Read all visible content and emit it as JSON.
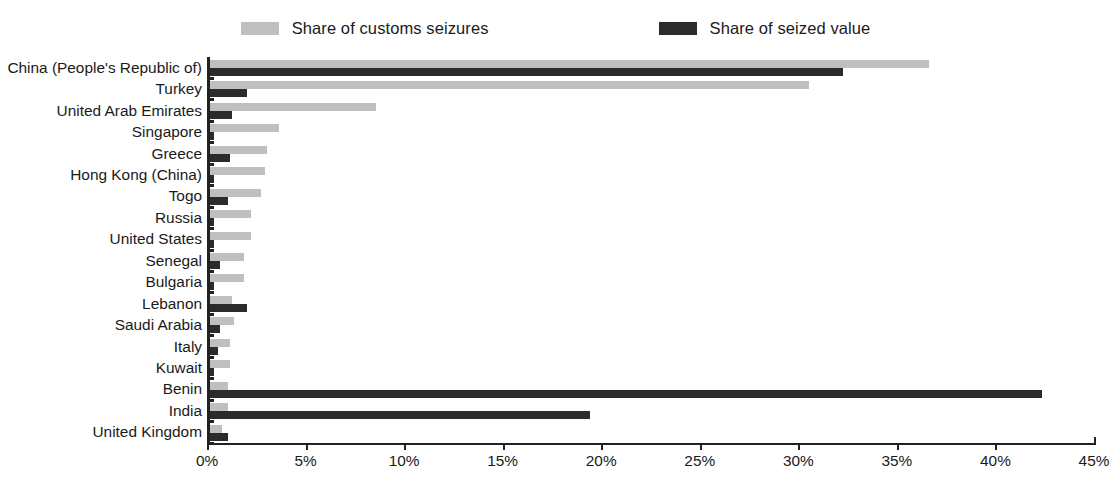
{
  "legend": {
    "entries": [
      {
        "label": "Share of customs seizures",
        "color": "#bfbfbf",
        "key": "customs_seizures"
      },
      {
        "label": "Share of seized value",
        "color": "#2b2b2b",
        "key": "seized_value"
      }
    ]
  },
  "axis": {
    "tick_labels": [
      "0%",
      "5%",
      "10%",
      "15%",
      "20%",
      "25%",
      "30%",
      "35%",
      "40%",
      "45%"
    ],
    "min": 0,
    "max": 45
  },
  "chart_data": {
    "type": "bar",
    "orientation": "horizontal",
    "title": "",
    "subtitle": "",
    "xlabel": "",
    "ylabel": "",
    "xlim": [
      0,
      45
    ],
    "xtick_labels": [
      "0%",
      "5%",
      "10%",
      "15%",
      "20%",
      "25%",
      "30%",
      "35%",
      "40%",
      "45%"
    ],
    "grid": false,
    "legend_position": "top-center",
    "units": "percent",
    "categories": [
      "China (People's Republic of)",
      "Turkey",
      "United Arab Emirates",
      "Singapore",
      "Greece",
      "Hong Kong (China)",
      "Togo",
      "Russia",
      "United States",
      "Senegal",
      "Bulgaria",
      "Lebanon",
      "Saudi Arabia",
      "Italy",
      "Kuwait",
      "Benin",
      "India",
      "United Kingdom"
    ],
    "series": [
      {
        "name": "Share of customs seizures",
        "color": "#bfbfbf",
        "values": [
          36.5,
          30.4,
          8.4,
          3.5,
          2.9,
          2.8,
          2.6,
          2.1,
          2.1,
          1.7,
          1.7,
          1.1,
          1.2,
          1.0,
          1.0,
          0.9,
          0.9,
          0.6
        ]
      },
      {
        "name": "Share of seized value",
        "color": "#2b2b2b",
        "values": [
          32.1,
          1.9,
          1.1,
          0.2,
          1.0,
          0.2,
          0.9,
          0.2,
          0.2,
          0.5,
          0.2,
          1.9,
          0.5,
          0.4,
          0.2,
          42.2,
          19.3,
          0.9
        ]
      }
    ]
  }
}
